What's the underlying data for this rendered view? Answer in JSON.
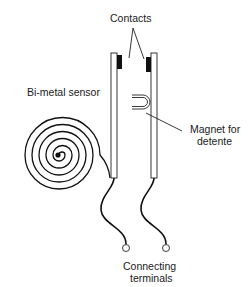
{
  "diagram": {
    "labels": {
      "contacts": "Contacts",
      "bimetal": "Bi-metal sensor",
      "magnet_line1": "Magnet for",
      "magnet_line2": "detente",
      "terminals_line1": "Connecting",
      "terminals_line2": "terminals"
    },
    "components": [
      "bi-metal spiral sensor",
      "left contact strip",
      "right contact strip",
      "contacts",
      "magnet",
      "connecting wires",
      "connecting terminals"
    ],
    "colors": {
      "stroke": "#111111",
      "background": "#ffffff"
    }
  }
}
